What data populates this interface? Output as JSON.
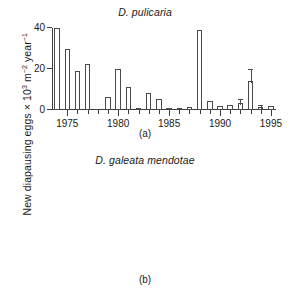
{
  "figure": {
    "ylabel_main": "New diapausing eggs × 10",
    "ylabel_sup1": "3",
    "ylabel_mid": " m",
    "ylabel_sup2": "−2",
    "ylabel_mid2": " year",
    "ylabel_sup3": "−1"
  },
  "panel_a": {
    "title": "D. pulicaria",
    "label": "(a)"
  },
  "panel_b": {
    "title": "D. galeata mendotae",
    "label": "(b)"
  },
  "chart_data": [
    {
      "type": "bar",
      "panel": "(a)",
      "title": "D. pulicaria",
      "xlabel": "",
      "ylabel": "New diapausing eggs × 10³ m⁻² year⁻¹",
      "xlim": [
        1973.5,
        1995.5
      ],
      "ylim": [
        0,
        40
      ],
      "yticks": [
        0,
        20,
        40
      ],
      "ytick_labels": [
        "0",
        "20",
        "40"
      ],
      "xticks": [
        1975,
        1976,
        1977,
        1978,
        1979,
        1980,
        1981,
        1982,
        1983,
        1984,
        1985,
        1986,
        1987,
        1988,
        1989,
        1990,
        1991,
        1992,
        1993,
        1994,
        1995
      ],
      "xtick_labels": [
        "1975",
        "",
        "",
        "",
        "",
        "1980",
        "",
        "",
        "",
        "",
        "1985",
        "",
        "",
        "",
        "",
        "1990",
        "",
        "",
        "",
        "",
        "1995"
      ],
      "major_xticks": [
        1975,
        1980,
        1985,
        1990,
        1995
      ],
      "grid": false,
      "legend": false,
      "categories": [
        1974,
        1975,
        1976,
        1977,
        1978,
        1979,
        1980,
        1981,
        1982,
        1983,
        1984,
        1985,
        1986,
        1987,
        1988,
        1989,
        1990,
        1991,
        1992,
        1993,
        1994,
        1995
      ],
      "values": [
        40.0,
        30.0,
        19.0,
        22.5,
        0,
        6.2,
        20.2,
        11.2,
        1.2,
        8.2,
        5.2,
        0.7,
        0.4,
        1.4,
        39.0,
        4.6,
        2.2,
        2.6,
        3.4,
        14.2,
        1.4,
        2.2
      ],
      "errors": [
        null,
        null,
        null,
        null,
        null,
        null,
        null,
        null,
        null,
        null,
        null,
        null,
        null,
        null,
        null,
        null,
        null,
        null,
        1.6,
        5.2,
        0.7,
        null
      ],
      "notes": "1974 bar is clipped at the top of the axis; 1978 has no bar."
    },
    {
      "type": "bar",
      "panel": "(b)",
      "title": "D. galeata mendotae",
      "xlabel": "",
      "ylabel": "New diapausing eggs × 10³ m⁻² year⁻¹",
      "xlim": [
        1973.5,
        1995.5
      ],
      "ylim": [
        0,
        4
      ],
      "yticks": [
        0,
        2,
        4
      ],
      "ytick_labels": [
        "0",
        "2",
        "4"
      ],
      "xticks": [
        1975,
        1976,
        1977,
        1978,
        1979,
        1980,
        1981,
        1982,
        1983,
        1984,
        1985,
        1986,
        1987,
        1988,
        1989,
        1990,
        1991,
        1992,
        1993,
        1994,
        1995
      ],
      "xtick_labels": [
        "1975",
        "",
        "",
        "",
        "",
        "1980",
        "",
        "",
        "",
        "",
        "1985",
        "",
        "",
        "",
        "",
        "1990",
        "",
        "",
        "",
        "",
        "1995"
      ],
      "major_xticks": [
        1975,
        1980,
        1985,
        1990,
        1995
      ],
      "grid": false,
      "legend": false,
      "categories": [
        1974,
        1975,
        1976,
        1977,
        1978,
        1979,
        1980,
        1981,
        1982,
        1983,
        1984,
        1985,
        1986,
        1987,
        1988,
        1989,
        1990,
        1991,
        1992,
        1993,
        1994,
        1995
      ],
      "values": [
        0,
        0,
        0,
        0,
        0,
        0.09,
        0.09,
        0.06,
        0.34,
        0.17,
        2.05,
        1.8,
        0,
        2.55,
        0,
        0.28,
        1.1,
        1.25,
        0.07,
        0.07,
        0,
        0
      ],
      "errors": [
        null,
        null,
        null,
        null,
        null,
        null,
        null,
        null,
        null,
        null,
        null,
        null,
        null,
        null,
        null,
        null,
        null,
        0.3,
        0.05,
        0.05,
        null,
        null
      ],
      "zero_labels": [
        1975,
        1976,
        1977,
        1978,
        1984,
        1986,
        1988,
        1995
      ],
      "zero_label_text": "0",
      "notes": "Years with an explicit '0' glyph printed just above the baseline denote zero egg production."
    }
  ]
}
